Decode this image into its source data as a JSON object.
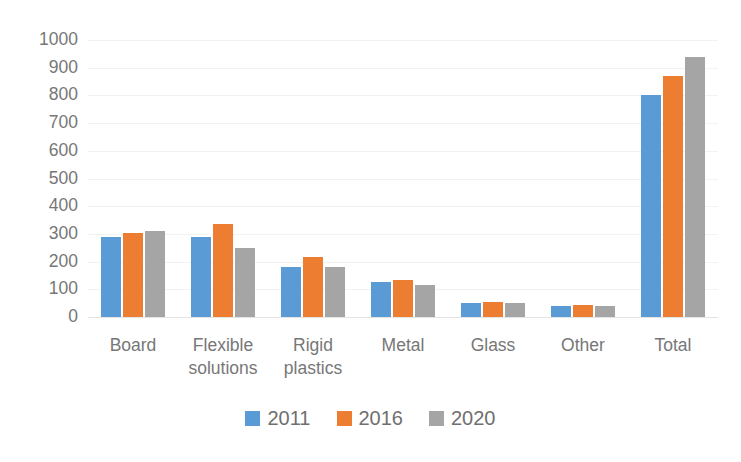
{
  "chart_data": {
    "type": "bar",
    "title": "",
    "subtitle": "",
    "xlabel": "",
    "ylabel": "",
    "ylim": [
      0,
      1000
    ],
    "ytick_step": 100,
    "ytick_labels": [
      "1000",
      "900",
      "800",
      "700",
      "600",
      "500",
      "400",
      "300",
      "200",
      "100",
      "0"
    ],
    "ytick_values": [
      1000,
      900,
      800,
      700,
      600,
      500,
      400,
      300,
      200,
      100,
      0
    ],
    "grid": true,
    "grid_axis": "y",
    "legend_position": "bottom",
    "categories": [
      "Board",
      "Flexible\nsolutions",
      "Rigid\nplastics",
      "Metal",
      "Glass",
      "Other",
      "Total"
    ],
    "series": [
      {
        "name": "2011",
        "color": "#5B9BD5",
        "values": [
          290,
          290,
          180,
          125,
          50,
          40,
          800
        ]
      },
      {
        "name": "2016",
        "color": "#ED7D31",
        "values": [
          305,
          335,
          215,
          135,
          55,
          45,
          870
        ]
      },
      {
        "name": "2020",
        "color": "#A5A5A5",
        "values": [
          310,
          248,
          180,
          115,
          52,
          40,
          940
        ]
      }
    ]
  },
  "colors": {
    "series_2011": "#5B9BD5",
    "series_2016": "#ED7D31",
    "series_2020": "#A5A5A5",
    "axis_text": "#777777",
    "gridline": "#f2f2f2",
    "background": "#ffffff"
  }
}
